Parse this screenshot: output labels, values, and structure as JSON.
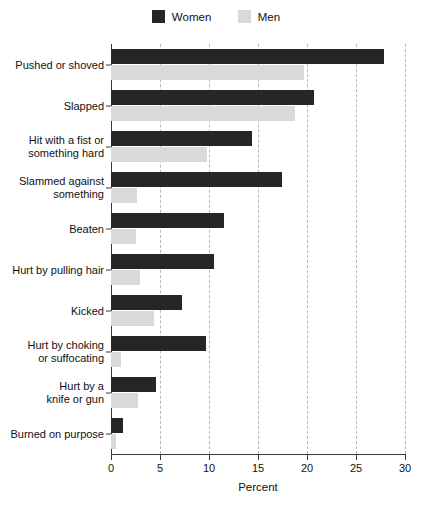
{
  "chart_data": {
    "type": "bar",
    "orientation": "horizontal",
    "title": "",
    "xlabel": "Percent",
    "ylabel": "",
    "xlim": [
      0,
      30
    ],
    "xticks": [
      0,
      5,
      10,
      15,
      20,
      25,
      30
    ],
    "grid": "vertical-dashed",
    "legend_position": "top-center",
    "categories": [
      "Pushed or shoved",
      "Slapped",
      "Hit with a fist or\nsomething hard",
      "Slammed against\nsomething",
      "Beaten",
      "Hurt by pulling hair",
      "Kicked",
      "Hurt by choking\nor suffocating",
      "Hurt by a\nknife or gun",
      "Burned on purpose"
    ],
    "series": [
      {
        "name": "Women",
        "color": "#262626",
        "values": [
          27.9,
          20.7,
          14.4,
          17.4,
          11.5,
          10.5,
          7.2,
          9.7,
          4.6,
          1.2
        ]
      },
      {
        "name": "Men",
        "color": "#d9d9d9",
        "values": [
          19.7,
          18.8,
          9.8,
          2.7,
          2.5,
          3.0,
          4.4,
          1.0,
          2.8,
          0.5
        ]
      }
    ]
  },
  "legend": {
    "items": [
      {
        "label": "Women",
        "color": "#262626"
      },
      {
        "label": "Men",
        "color": "#d9d9d9"
      }
    ]
  },
  "axis": {
    "x_title": "Percent",
    "x_tick_labels": [
      "0",
      "5",
      "10",
      "15",
      "20",
      "25",
      "30"
    ]
  }
}
